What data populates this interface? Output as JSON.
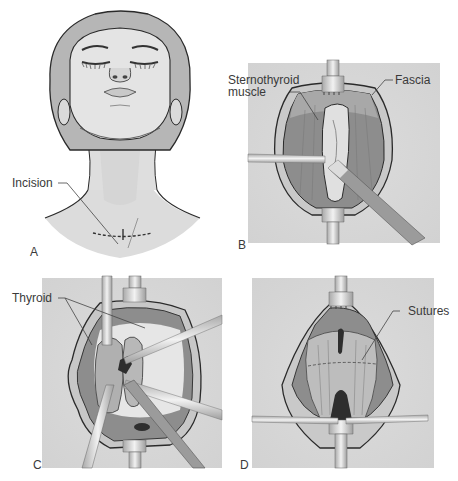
{
  "figure": {
    "panels": [
      {
        "id": "A",
        "letter": "A",
        "description": "Patient head extended, transverse neck incision marked",
        "labels": [
          {
            "text": "Incision"
          }
        ]
      },
      {
        "id": "B",
        "letter": "B",
        "description": "Retracted incision exposing fascia and sternothyroid muscle",
        "labels": [
          {
            "text": "Sternothyroid"
          },
          {
            "text": "muscle"
          },
          {
            "text": "Fascia"
          }
        ]
      },
      {
        "id": "C",
        "letter": "C",
        "description": "Thyroid exposed with multiple retractors",
        "labels": [
          {
            "text": "Thyroid"
          }
        ]
      },
      {
        "id": "D",
        "letter": "D",
        "description": "Closure of muscle layer with sutures",
        "labels": [
          {
            "text": "Sutures"
          }
        ]
      }
    ],
    "colors": {
      "panel_bg": "#d9d9d9",
      "skin": "#e3e3e3",
      "hair": "#b5b5b5",
      "muscle": "#8f8f8f",
      "muscle_light": "#b9b9b9",
      "fascia": "#c8c8c8",
      "instrument": "#cfcfcf",
      "outline": "#2a2a2a",
      "dark_cavity": "#2e2e2e"
    }
  }
}
